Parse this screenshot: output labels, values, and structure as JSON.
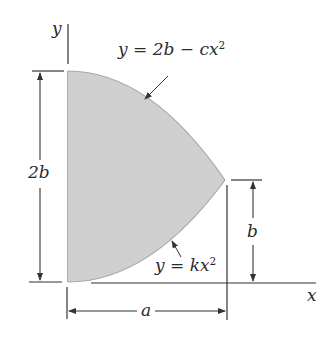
{
  "diagram": {
    "type": "area-between-parabolas",
    "colors": {
      "fill": "#cfcfcf",
      "line": "#333333",
      "curve_edge": "#a8a8a8",
      "background": "#ffffff"
    },
    "axes": {
      "x_label": "x",
      "y_label": "y"
    },
    "curves": {
      "upper": {
        "lhs": "y",
        "eq": "=",
        "rhs_a": "2b",
        "minus": "−",
        "rhs_b": "cx",
        "exp": "2"
      },
      "lower": {
        "lhs": "y",
        "eq": "=",
        "rhs": "kx",
        "exp": "2"
      }
    },
    "dimensions": {
      "height_total": "2b",
      "height_tip": "b",
      "width": "a"
    }
  }
}
